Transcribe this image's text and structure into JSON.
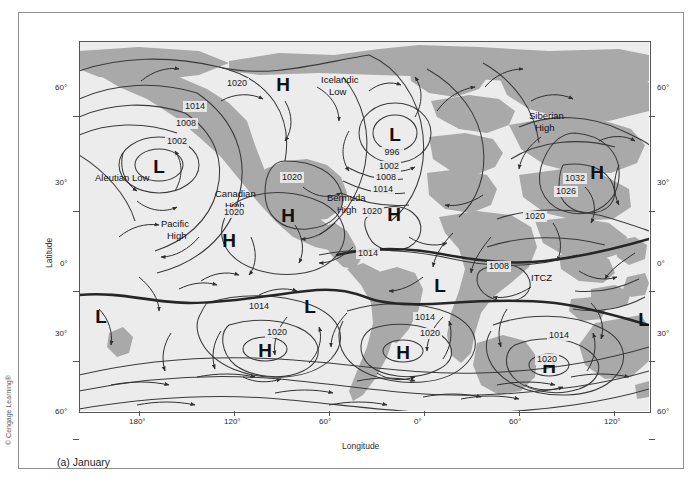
{
  "figure": {
    "caption": "(a) January",
    "credit": "© Cengage Learning®",
    "xlabel": "Longitude",
    "ylabel": "Latitude"
  },
  "axes": {
    "x_ticks": [
      "180°",
      "120°",
      "60°",
      "0°",
      "60°",
      "120°"
    ],
    "x_positions": [
      60,
      155,
      250,
      345,
      440,
      535
    ],
    "y_ticks_left": [
      "60°",
      "30°",
      "0°",
      "30°",
      "60°"
    ],
    "y_ticks_right": [
      "60°",
      "30°",
      "0°",
      "30°",
      "60°"
    ],
    "y_positions": [
      75,
      170,
      250,
      320,
      398
    ]
  },
  "colors": {
    "land": "#a9a9a9",
    "ocean": "#ececec",
    "isobar": "#3a3a3a",
    "itcz": "#262626",
    "frame": "#8d8d8d",
    "text": "#1d1d1d"
  },
  "chart_data": {
    "type": "map",
    "title": "(a) January",
    "map_projection": "cylindrical",
    "xlabel": "Longitude",
    "ylabel": "Latitude",
    "xlim": [
      "180W",
      "180E"
    ],
    "ylim": [
      "75S",
      "80N"
    ],
    "variable": "Sea-level pressure (mb) and surface winds",
    "contour_interval_mb": 6,
    "pressure_centers": [
      {
        "type": "L",
        "name": "Aleutian Low",
        "x": 80,
        "y": 124,
        "label_x": 66,
        "label_y": 156,
        "central_mb": 1002
      },
      {
        "type": "L",
        "name": "Icelandic Low",
        "x": 316,
        "y": 92,
        "label_x": 300,
        "label_y": 50,
        "central_mb": 996
      },
      {
        "type": "H",
        "name": "Siberian High",
        "x": 518,
        "y": 130,
        "label_x": 500,
        "label_y": 96,
        "central_mb": 1032
      },
      {
        "type": "H",
        "name": "Canadian High",
        "x": 209,
        "y": 173,
        "label_x": 190,
        "label_y": 199,
        "central_mb": 1020
      },
      {
        "type": "H",
        "name": "Bermuda High",
        "x": 315,
        "y": 172,
        "label_x": 300,
        "label_y": 200,
        "central_mb": 1020
      },
      {
        "type": "H",
        "name": "Pacific High",
        "x": 150,
        "y": 198,
        "label_x": 135,
        "label_y": 224,
        "central_mb": 1020
      },
      {
        "type": "H",
        "name": "South Pacific High",
        "x": 186,
        "y": 322,
        "central_mb": 1020
      },
      {
        "type": "H",
        "name": "South Atlantic High",
        "x": 322,
        "y": 322,
        "central_mb": 1020
      },
      {
        "type": "H",
        "name": "South Indian High",
        "x": 470,
        "y": 337,
        "central_mb": 1020
      },
      {
        "type": "L",
        "name": "Equatorial Low Pacific",
        "x": 72,
        "y": 274
      },
      {
        "type": "L",
        "name": "Amazon Low",
        "x": 281,
        "y": 264
      },
      {
        "type": "L",
        "name": "African Low",
        "x": 411,
        "y": 243,
        "central_mb": 1008
      },
      {
        "type": "L",
        "name": "Australian Low",
        "x": 637,
        "y": 277
      },
      {
        "type": "L",
        "name": "Southern Ocean Low",
        "x": 315,
        "y": 406
      }
    ],
    "isobar_labels": [
      {
        "value": "1020",
        "x": 158,
        "y": 45
      },
      {
        "value": "1014",
        "x": 116,
        "y": 68
      },
      {
        "value": "1008",
        "x": 107,
        "y": 85
      },
      {
        "value": "1002",
        "x": 98,
        "y": 103
      },
      {
        "value": "1020",
        "x": 213,
        "y": 139
      },
      {
        "value": "1020",
        "x": 155,
        "y": 174
      },
      {
        "value": "996",
        "x": 313,
        "y": 114
      },
      {
        "value": "1002",
        "x": 310,
        "y": 128
      },
      {
        "value": "1008",
        "x": 307,
        "y": 139
      },
      {
        "value": "1014",
        "x": 304,
        "y": 151
      },
      {
        "value": "1020",
        "x": 293,
        "y": 173
      },
      {
        "value": "1014",
        "x": 289,
        "y": 215
      },
      {
        "value": "1032",
        "x": 496,
        "y": 140
      },
      {
        "value": "1026",
        "x": 487,
        "y": 153
      },
      {
        "value": "1020",
        "x": 456,
        "y": 178
      },
      {
        "value": "1008",
        "x": 420,
        "y": 228
      },
      {
        "value": "1008",
        "x": 597,
        "y": 245
      },
      {
        "value": "1014",
        "x": 180,
        "y": 268
      },
      {
        "value": "1020",
        "x": 198,
        "y": 294
      },
      {
        "value": "1014",
        "x": 346,
        "y": 279
      },
      {
        "value": "1020",
        "x": 351,
        "y": 295
      },
      {
        "value": "1014",
        "x": 480,
        "y": 297
      },
      {
        "value": "1020",
        "x": 468,
        "y": 321
      },
      {
        "value": "1008",
        "x": 602,
        "y": 374
      },
      {
        "value": "1002",
        "x": 602,
        "y": 390
      }
    ],
    "front_labels": [
      {
        "name": "ITCZ",
        "x": 525,
        "y": 265
      }
    ]
  }
}
